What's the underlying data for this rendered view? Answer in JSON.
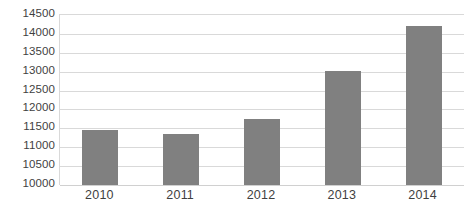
{
  "chart_data": {
    "type": "bar",
    "title": "",
    "subtitle": "",
    "xlabel": "",
    "ylabel": "",
    "categories": [
      "2010",
      "2011",
      "2012",
      "2013",
      "2014"
    ],
    "values": [
      11450,
      11350,
      11750,
      13020,
      14215
    ],
    "series": [
      {
        "name": "",
        "values": [
          11450,
          11350,
          11750,
          13020,
          14215
        ]
      }
    ],
    "ylim": [
      10000,
      14500
    ],
    "ytick_step": 500,
    "ytick_labels": [
      "14500",
      "14000",
      "13500",
      "13000",
      "12500",
      "12000",
      "11500",
      "11000",
      "10500",
      "10000"
    ],
    "ytick_values": [
      14500,
      14000,
      13500,
      13000,
      12500,
      12000,
      11500,
      11000,
      10500,
      10000
    ],
    "grid": "horizontal",
    "legend": "none",
    "annotations": [],
    "colors": {
      "bar_fill": "#808080",
      "gridline": "#d9d9d9",
      "axis_line": "#d0d0d0",
      "label_text": "#3f3f3f",
      "background": "#ffffff"
    }
  }
}
